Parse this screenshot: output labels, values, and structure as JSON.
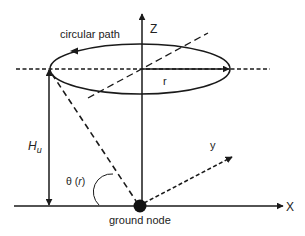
{
  "diagram": {
    "type": "geometry-illustration",
    "labels": {
      "circular_path": "circular path",
      "z_axis": "Z",
      "x_axis": "X",
      "y_axis": "y",
      "radius": "r",
      "height": "H",
      "height_subscript": "u",
      "angle": "θ (",
      "angle_var": "r",
      "angle_close": ")",
      "ground_node": "ground node"
    },
    "elements": [
      {
        "name": "circular-path-ellipse",
        "center": [
          142,
          69
        ],
        "rx": 88,
        "ry": 25,
        "direction": "counter-clockwise arrow on top-left"
      },
      {
        "name": "z-axis",
        "from": [
          142,
          206
        ],
        "to": [
          142,
          13
        ],
        "style": "solid arrow"
      },
      {
        "name": "x-axis",
        "from": [
          14,
          206
        ],
        "to": [
          283,
          206
        ],
        "style": "solid arrow"
      },
      {
        "name": "y-axis",
        "from": [
          142,
          204
        ],
        "to": [
          232,
          156
        ],
        "style": "dashed arrow"
      },
      {
        "name": "radius-arrow",
        "from": [
          142,
          69
        ],
        "to": [
          230,
          69
        ],
        "style": "solid arrow"
      },
      {
        "name": "height-arrow",
        "from": [
          49,
          69
        ],
        "to": [
          49,
          206
        ],
        "style": "double-headed arrow"
      },
      {
        "name": "line-of-sight",
        "from": [
          50,
          72
        ],
        "to": [
          140,
          206
        ],
        "style": "dashed"
      },
      {
        "name": "plane-horizontal",
        "from": [
          16,
          69
        ],
        "to": [
          270,
          69
        ],
        "style": "dashed"
      },
      {
        "name": "plane-diagonal",
        "from": [
          88,
          98
        ],
        "to": [
          208,
          33
        ],
        "style": "dashed"
      },
      {
        "name": "ground-node",
        "center": [
          140,
          206
        ],
        "radius": 6
      }
    ],
    "colors": {
      "stroke": "#1a1a1a",
      "text": "#222222",
      "background": "#ffffff"
    }
  }
}
